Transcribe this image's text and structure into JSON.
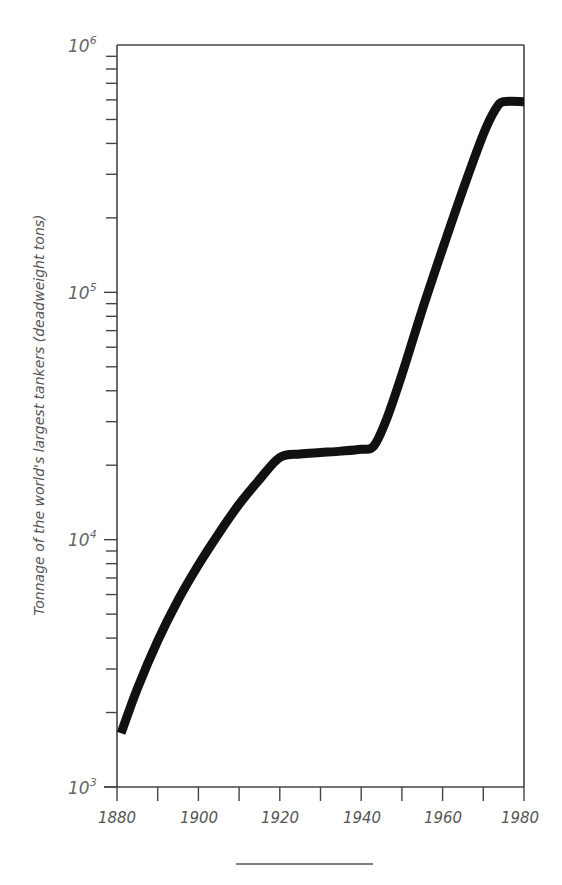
{
  "chart_data": {
    "type": "line",
    "title": "",
    "xlabel": "",
    "ylabel": "Tonnage of the world's largest tankers (deadweight tons)",
    "yscale": "log",
    "xlim": [
      1880,
      1980
    ],
    "ylim": [
      1000,
      1000000
    ],
    "grid": false,
    "legend": null,
    "x_ticks": [
      1880,
      1890,
      1900,
      1910,
      1920,
      1930,
      1940,
      1950,
      1960,
      1970,
      1980
    ],
    "x_tick_labels": [
      "1880",
      "1900",
      "1920",
      "1940",
      "1960",
      "1980"
    ],
    "y_tick_labels": [
      {
        "base": "10",
        "exp": "3",
        "value": 1000
      },
      {
        "base": "10",
        "exp": "4",
        "value": 10000
      },
      {
        "base": "10",
        "exp": "5",
        "value": 100000
      },
      {
        "base": "10",
        "exp": "6",
        "value": 1000000
      }
    ],
    "series": [
      {
        "name": "Largest tanker tonnage",
        "color": "#111111",
        "x": [
          1881,
          1885,
          1890,
          1895,
          1900,
          1905,
          1910,
          1915,
          1920,
          1925,
          1930,
          1935,
          1940,
          1943,
          1946,
          1950,
          1955,
          1960,
          1965,
          1970,
          1973,
          1975,
          1980
        ],
        "values": [
          1650,
          2500,
          3900,
          5700,
          7900,
          10600,
          13900,
          17500,
          21500,
          22200,
          22500,
          22800,
          23200,
          23800,
          30000,
          46500,
          85000,
          150000,
          260000,
          435000,
          550000,
          590000,
          590000
        ]
      }
    ]
  },
  "labels": {
    "y_axis_title": "Tonnage of the world's largest tankers (deadweight tons)",
    "x_1880": "1880",
    "x_1900": "1900",
    "x_1920": "1920",
    "x_1940": "1940",
    "x_1960": "1960",
    "x_1980": "1980",
    "y_base": "10",
    "y_exp_3": "3",
    "y_exp_4": "4",
    "y_exp_5": "5",
    "y_exp_6": "6"
  }
}
